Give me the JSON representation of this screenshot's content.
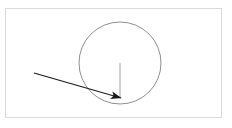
{
  "figure": {
    "title": "",
    "background_color": "#ffffff",
    "width": 232,
    "height": 128
  },
  "frame": {
    "name": "diagram-border",
    "x": 5,
    "y": 8,
    "width": 217,
    "height": 110,
    "stroke_color": "#d9d9d9",
    "stroke_width": 1,
    "fill": "#ffffff"
  },
  "chart_data": {
    "type": "scatter",
    "title": "",
    "xlabel": "",
    "ylabel": "",
    "grid": false,
    "legend": null,
    "xlim": [
      0,
      232
    ],
    "ylim": [
      0,
      128
    ],
    "shapes": [
      {
        "name": "circle-outline",
        "kind": "circle",
        "cx": 120,
        "cy": 63,
        "r": 41,
        "stroke_color": "#8f8f8f",
        "stroke_width": 1,
        "fill": "none"
      },
      {
        "name": "radius-line",
        "kind": "line",
        "x1": 120,
        "y1": 63,
        "x2": 120,
        "y2": 97,
        "stroke_color": "#a0a0a0",
        "stroke_width": 1
      },
      {
        "name": "incoming-arrow",
        "kind": "arrow",
        "x1": 34,
        "y1": 73,
        "x2": 121,
        "y2": 98,
        "stroke_color": "#1a1a1a",
        "stroke_width": 1.1,
        "arrowhead": "solid-triangle",
        "arrowhead_length": 11,
        "arrowhead_width": 7
      }
    ],
    "annotations": []
  }
}
